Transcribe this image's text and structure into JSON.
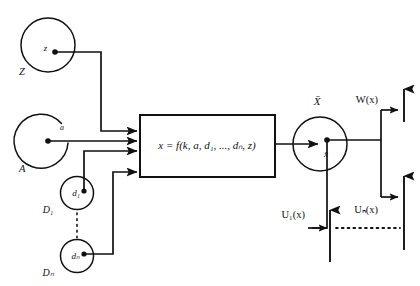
{
  "diagram": {
    "colors": {
      "stroke": "#111111",
      "background": "#ffffff",
      "text": "#111111"
    },
    "inputs": [
      {
        "id": "Z",
        "set_label": "Z",
        "element_label": "z",
        "shape": "circle",
        "open_gap": false
      },
      {
        "id": "A",
        "set_label": "A",
        "element_label": "a",
        "shape": "circle",
        "open_gap": true
      },
      {
        "id": "D1",
        "set_label": "D₁",
        "element_label": "d₁",
        "shape": "circle",
        "open_gap": false
      },
      {
        "id": "Dn",
        "set_label": "Dₙ",
        "element_label": "dₙ",
        "shape": "circle",
        "open_gap": false
      }
    ],
    "vertical_dots_between": "D₁ ⋮ Dₙ",
    "process_box": {
      "formula": "x = f(k, a, d₁, ..., dₙ, z)",
      "formula_parts": {
        "lhs": "x",
        "equals": "=",
        "fn": "f",
        "args": [
          "k",
          "a",
          "d₁",
          "...",
          "dₙ",
          "z"
        ]
      },
      "input_arrow_count": 4
    },
    "output": {
      "set_label": "X̄",
      "element_label": "x̄",
      "shape": "circle"
    },
    "output_functions": [
      {
        "id": "W",
        "label": "W(x)"
      },
      {
        "id": "Un",
        "label": "Uₙ(x)"
      },
      {
        "id": "U1",
        "label": "U₁(x)"
      }
    ],
    "horizontal_dots": "· · · · · ·"
  }
}
